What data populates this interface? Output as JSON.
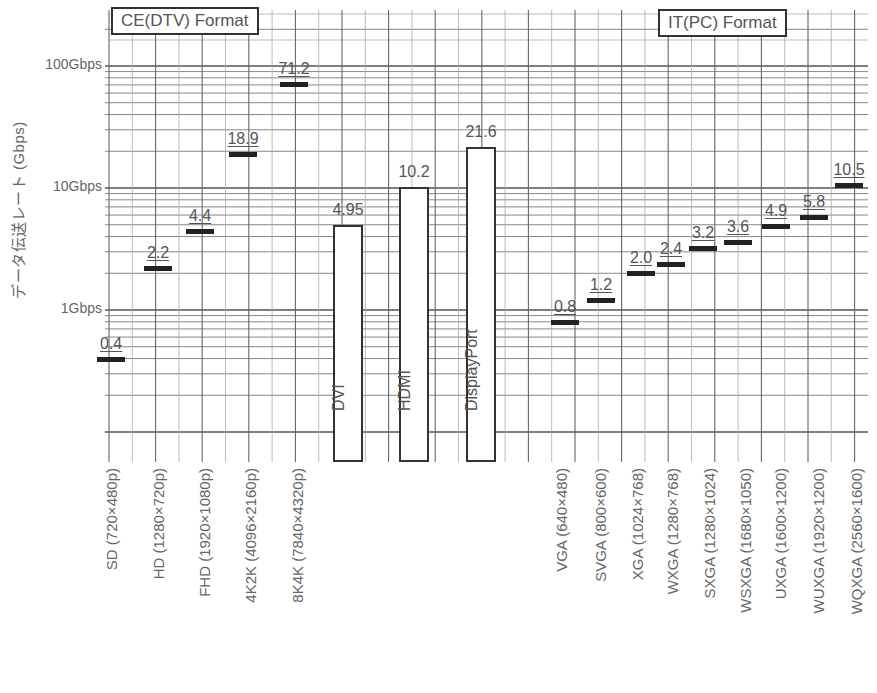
{
  "chart_data": {
    "type": "bar",
    "title": "",
    "ylabel": "データ伝送レート (Gbps)",
    "xlabel": "",
    "yscale": "log",
    "ylim": [
      0.1,
      200
    ],
    "yticks": [
      {
        "value": 100,
        "label": "100Gbps"
      },
      {
        "value": 10,
        "label": "10Gbps"
      },
      {
        "value": 1,
        "label": "1Gbps"
      }
    ],
    "grid": true,
    "legend_boxes": [
      {
        "label": "CE(DTV) Format",
        "position": "top-left"
      },
      {
        "label": "IT(PC) Format",
        "position": "top-right"
      }
    ],
    "groups": [
      {
        "name": "CE(DTV) Format",
        "marker": "dash",
        "categories": [
          "SD (720×480p)",
          "HD (1280×720p)",
          "FHD (1920×1080p)",
          "4K2K (4096×2160p)",
          "8K4K (7840×4320p)"
        ],
        "values": [
          0.4,
          2.2,
          4.4,
          18.9,
          71.2
        ],
        "labels": [
          "0.4",
          "2.2",
          "4.4",
          "18.9",
          "71.2"
        ]
      },
      {
        "name": "Interfaces",
        "marker": "bar",
        "categories": [
          "DVI",
          "HDMI",
          "DisplayPort"
        ],
        "values": [
          4.95,
          10.2,
          21.6
        ],
        "labels": [
          "4.95",
          "10.2",
          "21.6"
        ]
      },
      {
        "name": "IT(PC) Format",
        "marker": "dash",
        "categories": [
          "VGA (640×480)",
          "SVGA (800×600)",
          "XGA (1024×768)",
          "WXGA (1280×768)",
          "SXGA (1280×1024)",
          "WSXGA (1680×1050)",
          "UXGA (1600×1200)",
          "WUXGA (1920×1200)",
          "WQXGA (2560×1600)"
        ],
        "values": [
          0.8,
          1.2,
          2.0,
          2.4,
          3.2,
          3.6,
          4.9,
          5.8,
          10.5
        ],
        "labels": [
          "0.8",
          "1.2",
          "2.0",
          "2.4",
          "3.2",
          "3.6",
          "4.9",
          "5.8",
          "10.5"
        ]
      }
    ]
  },
  "axis": {
    "ylabel": "データ伝送レート (Gbps)",
    "ticks": [
      "100Gbps",
      "10Gbps",
      "1Gbps"
    ]
  },
  "legend": {
    "ce": "CE(DTV) Format",
    "it": "IT(PC) Format"
  },
  "ce": {
    "items": [
      {
        "label": "SD (720×480p)",
        "value": "0.4"
      },
      {
        "label": "HD (1280×720p)",
        "value": "2.2"
      },
      {
        "label": "FHD (1920×1080p)",
        "value": "4.4"
      },
      {
        "label": "4K2K (4096×2160p)",
        "value": "18.9"
      },
      {
        "label": "8K4K (7840×4320p)",
        "value": "71.2"
      }
    ]
  },
  "interfaces": {
    "items": [
      {
        "label": "DVI",
        "value": "4.95"
      },
      {
        "label": "HDMI",
        "value": "10.2"
      },
      {
        "label": "DisplayPort",
        "value": "21.6"
      }
    ]
  },
  "it": {
    "items": [
      {
        "label": "VGA (640×480)",
        "value": "0.8"
      },
      {
        "label": "SVGA (800×600)",
        "value": "1.2"
      },
      {
        "label": "XGA (1024×768)",
        "value": "2.0"
      },
      {
        "label": "WXGA (1280×768)",
        "value": "2.4"
      },
      {
        "label": "SXGA (1280×1024)",
        "value": "3.2"
      },
      {
        "label": "WSXGA (1680×1050)",
        "value": "3.6"
      },
      {
        "label": "UXGA (1600×1200)",
        "value": "4.9"
      },
      {
        "label": "WUXGA (1920×1200)",
        "value": "5.8"
      },
      {
        "label": "WQXGA (2560×1600)",
        "value": "10.5"
      }
    ]
  }
}
